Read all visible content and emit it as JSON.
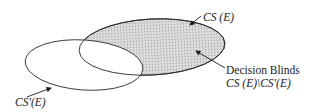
{
  "diagram": {
    "type": "venn",
    "sets": [
      {
        "id": "cs_e",
        "label": "CS (E)",
        "fill": "dotted-gray"
      },
      {
        "id": "cs_prime_e",
        "label": "CS'(E)",
        "fill": "white"
      }
    ],
    "region": {
      "name": "Decision Blinds",
      "formula": "CS (E)\\CS'(E)"
    },
    "colors": {
      "stroke": "#2b2b2b",
      "dot_fill": "#b8b8b8",
      "background": "#ffffff"
    }
  },
  "labels": {
    "cs_e": "CS (E)",
    "decision_blinds": "Decision Blinds",
    "difference": "CS (E)\\CS′(E)",
    "cs_prime_e": "CS′(E)"
  }
}
